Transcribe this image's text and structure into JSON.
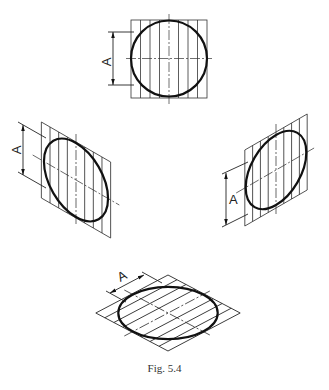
{
  "figure": {
    "caption": "Fig. 5.4",
    "dimension_label": "A",
    "views": [
      {
        "id": "top",
        "description": "Circle in square with vertical hatching lines, front view",
        "dimension_label": "A"
      },
      {
        "id": "left",
        "description": "Ellipse in parallelogram (left isometric face) with vertical hatching",
        "dimension_label": "A"
      },
      {
        "id": "right",
        "description": "Ellipse in parallelogram (right isometric face) with vertical hatching",
        "dimension_label": "A"
      },
      {
        "id": "bottom",
        "description": "Ellipse in rhombus (horizontal isometric face) with oblique hatching",
        "dimension_label": "A"
      }
    ]
  }
}
